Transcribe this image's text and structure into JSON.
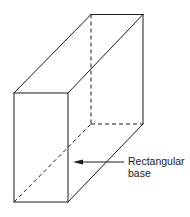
{
  "diagram": {
    "type": "3d-rectangular-prism",
    "annotation": {
      "line1": "Rectangular",
      "line2": "base"
    },
    "colors": {
      "stroke": "#1a1a1a",
      "background": "#ffffff"
    }
  }
}
